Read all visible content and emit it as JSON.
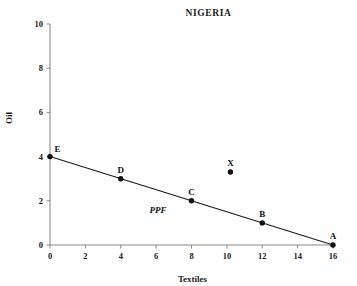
{
  "chart_data": {
    "type": "line",
    "title": "NIGERIA",
    "xlabel": "Textiles",
    "ylabel": "Oil",
    "xlim": [
      0,
      16
    ],
    "ylim": [
      0,
      10
    ],
    "xticks": [
      "0",
      "2",
      "4",
      "6",
      "8",
      "10",
      "12",
      "14",
      "16"
    ],
    "xtick_values": [
      0,
      2,
      4,
      6,
      8,
      10,
      12,
      14,
      16
    ],
    "yticks": [
      "0",
      "2",
      "4",
      "6",
      "8",
      "10"
    ],
    "ytick_values": [
      0,
      2,
      4,
      6,
      8,
      10
    ],
    "grid": false,
    "legend": "none",
    "series": [
      {
        "name": "PPF",
        "label": "PPF",
        "type": "line",
        "x": [
          0,
          16
        ],
        "y": [
          4,
          0
        ],
        "color": "#1a1a1a"
      }
    ],
    "points": [
      {
        "label": "E",
        "x": 0,
        "y": 4,
        "on_curve": true,
        "label_pos": "above-right"
      },
      {
        "label": "D",
        "x": 4,
        "y": 3,
        "on_curve": true,
        "label_pos": "above"
      },
      {
        "label": "C",
        "x": 8,
        "y": 2,
        "on_curve": true,
        "label_pos": "above"
      },
      {
        "label": "B",
        "x": 12,
        "y": 1,
        "on_curve": true,
        "label_pos": "above"
      },
      {
        "label": "A",
        "x": 16,
        "y": 0,
        "on_curve": true,
        "label_pos": "above"
      },
      {
        "label": "X",
        "x": 10.2,
        "y": 3.3,
        "on_curve": false,
        "label_pos": "above"
      }
    ],
    "annotations": [
      {
        "text": "PPF",
        "x": 6.1,
        "y": 1.9,
        "style": "italic"
      }
    ],
    "colors": {
      "line": "#1a1a1a",
      "axis": "#8a8a8a",
      "marker": "#111111",
      "background": "#ffffff",
      "text": "#1a1a1a"
    }
  }
}
